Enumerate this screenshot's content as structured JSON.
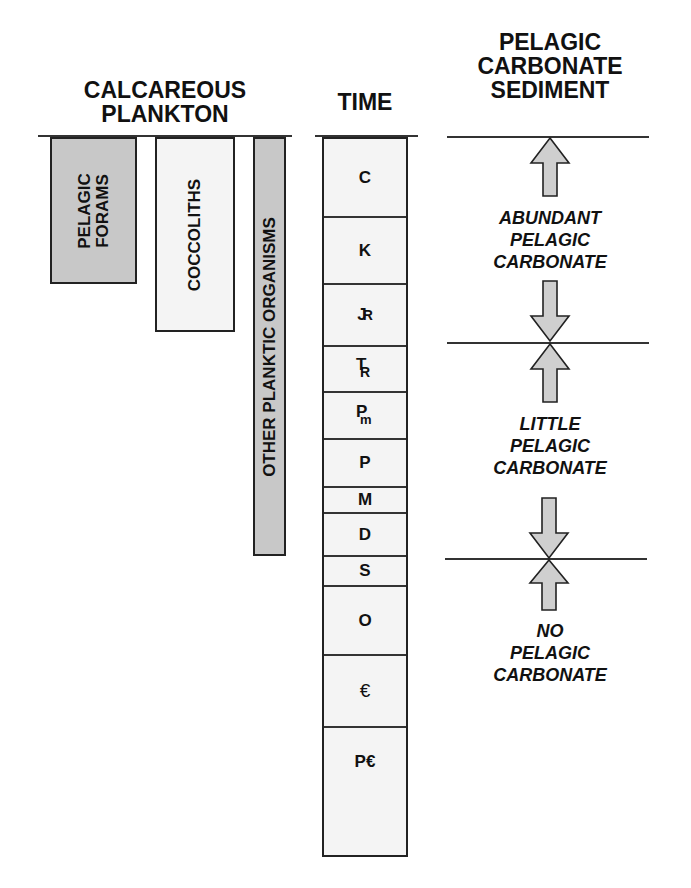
{
  "headers": {
    "plankton": "CALCAREOUS\nPLANKTON",
    "plankton_line1": "CALCAREOUS",
    "plankton_line2": "PLANKTON",
    "time": "TIME",
    "sediment_line1": "PELAGIC",
    "sediment_line2": "CARBONATE",
    "sediment_line3": "SEDIMENT"
  },
  "plankton": [
    {
      "line1": "PELAGIC",
      "line2": "FORAMS",
      "fill": "#c8c8c8"
    },
    {
      "line1": "COCCOLITHS",
      "fill": "#f4f4f4"
    },
    {
      "line1": "OTHER PLANKTIC ORGANISMS",
      "fill": "#c8c8c8"
    }
  ],
  "time_periods": [
    {
      "symbol": "C",
      "name": "Cenozoic"
    },
    {
      "symbol": "K",
      "name": "Cretaceous"
    },
    {
      "symbol": "J",
      "sub": "R",
      "name": "Jurassic"
    },
    {
      "symbol": "T",
      "sub": "R",
      "name": "Triassic"
    },
    {
      "symbol": "P",
      "sub": "m",
      "name": "Permian"
    },
    {
      "symbol": "P",
      "name": "Pennsylvanian"
    },
    {
      "symbol": "M",
      "name": "Mississippian"
    },
    {
      "symbol": "D",
      "name": "Devonian"
    },
    {
      "symbol": "S",
      "name": "Silurian"
    },
    {
      "symbol": "O",
      "name": "Ordovician"
    },
    {
      "symbol": "€",
      "name": "Cambrian"
    },
    {
      "symbol": "P€",
      "name": "Precambrian"
    }
  ],
  "sediment_zones": [
    {
      "line1": "ABUNDANT",
      "line2": "PELAGIC",
      "line3": "CARBONATE"
    },
    {
      "line1": "LITTLE",
      "line2": "PELAGIC",
      "line3": "CARBONATE"
    },
    {
      "line1": "NO",
      "line2": "PELAGIC",
      "line3": "CARBONATE"
    }
  ],
  "colors": {
    "gray_fill": "#c8c8c8",
    "light_fill": "#f4f4f4",
    "arrow_fill": "#cfcfcf",
    "stroke": "#222222"
  }
}
